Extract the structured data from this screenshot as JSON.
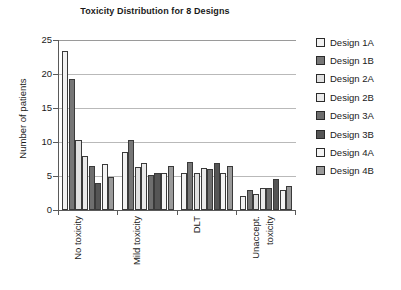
{
  "chart_data": {
    "type": "bar",
    "title": "Toxicity Distribution for 8 Designs",
    "xlabel": "",
    "ylabel": "Number of patients",
    "ylim": [
      0,
      25
    ],
    "yticks": [
      0,
      5,
      10,
      15,
      20,
      25
    ],
    "grid": true,
    "legend_position": "right",
    "categories": [
      "No toxicity",
      "Mild toxicity",
      "DLT",
      "Unaccept. toxicity"
    ],
    "category_lines": [
      [
        "No toxicity"
      ],
      [
        "Mild toxicity"
      ],
      [
        "DLT"
      ],
      [
        "Unaccept.",
        "toxicity"
      ]
    ],
    "series": [
      {
        "name": "Design 1A",
        "swatch": "#f2f2f2",
        "values": [
          23.4,
          8.5,
          5.5,
          2.0
        ]
      },
      {
        "name": "Design 1B",
        "swatch": "#767676",
        "values": [
          19.2,
          10.3,
          7.1,
          3.0
        ]
      },
      {
        "name": "Design 2A",
        "swatch": "#e0e0e0",
        "values": [
          10.3,
          6.3,
          5.4,
          2.3
        ]
      },
      {
        "name": "Design 2B",
        "swatch": "#eaeaea",
        "values": [
          7.9,
          6.9,
          6.2,
          3.2
        ]
      },
      {
        "name": "Design 3A",
        "swatch": "#6e6e6e",
        "values": [
          6.4,
          5.2,
          6.0,
          3.3
        ]
      },
      {
        "name": "Design 3B",
        "swatch": "#555555",
        "values": [
          3.9,
          5.5,
          6.9,
          4.5
        ]
      },
      {
        "name": "Design 4A",
        "swatch": "#f4f4f4",
        "values": [
          6.8,
          5.5,
          5.5,
          2.9
        ]
      },
      {
        "name": "Design 4B",
        "swatch": "#9a9a9a",
        "values": [
          4.8,
          6.5,
          6.4,
          3.5
        ]
      }
    ]
  },
  "legend": {
    "items": [
      {
        "label": "Design 1A"
      },
      {
        "label": "Design 1B"
      },
      {
        "label": "Design 2A"
      },
      {
        "label": "Design 2B"
      },
      {
        "label": "Design 3A"
      },
      {
        "label": "Design 3B"
      },
      {
        "label": "Design 4A"
      },
      {
        "label": "Design 4B"
      }
    ]
  }
}
